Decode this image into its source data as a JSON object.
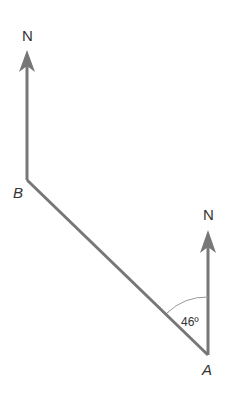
{
  "diagram": {
    "type": "bearing-diagram",
    "points": {
      "A": {
        "label": "A",
        "x": 208,
        "y": 355
      },
      "B": {
        "label": "B",
        "x": 27,
        "y": 180
      }
    },
    "north_labels": {
      "at_B": "N",
      "at_A": "N"
    },
    "angle": {
      "label": "46º",
      "value_degrees": 46,
      "between": "North from A and line AB"
    },
    "colors": {
      "lines": "#777777",
      "text": "#333333",
      "arc": "#999999"
    }
  }
}
